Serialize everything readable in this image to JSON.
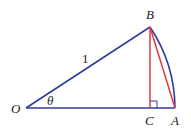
{
  "diagram": {
    "colors": {
      "blue": "#2e3d9e",
      "red": "#e0393e",
      "text": "#222222"
    },
    "points": {
      "O": {
        "label": "O",
        "x": 26,
        "y": 108
      },
      "B": {
        "label": "B",
        "x": 150,
        "y": 27
      },
      "C": {
        "label": "C",
        "x": 150,
        "y": 108
      },
      "A": {
        "label": "A",
        "x": 175,
        "y": 108
      }
    },
    "labels": {
      "radius": "1",
      "angle": "θ",
      "O": "O",
      "B": "B",
      "C": "C",
      "A": "A"
    },
    "segments": [
      {
        "from": "O",
        "to": "B",
        "color": "blue"
      },
      {
        "from": "O",
        "to": "A",
        "color": "blue"
      },
      {
        "from": "B",
        "to": "C",
        "color": "red"
      },
      {
        "from": "B",
        "to": "A",
        "color": "red"
      }
    ],
    "arc": {
      "from": "B",
      "to": "A",
      "center": "O",
      "color": "blue"
    },
    "right_angle_marker": "C"
  }
}
